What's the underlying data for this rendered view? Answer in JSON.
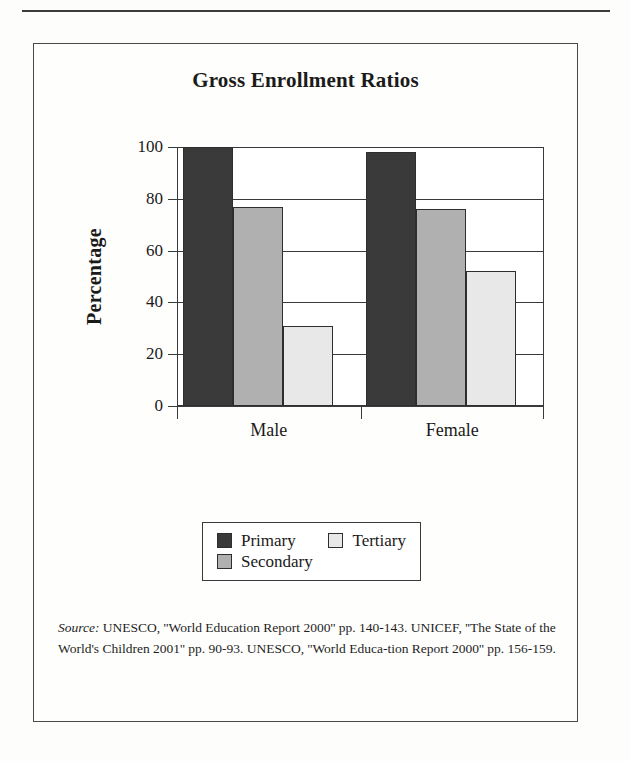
{
  "figure": {
    "title": "Gross Enrollment Ratios",
    "source_keyword": "Source:",
    "source_text": " UNESCO, ''World Education Report 2000'' pp. 140-143. UNICEF, ''The State of the World's Children 2001'' pp. 90-93. UNESCO, ''World Educa-tion Report 2000'' pp. 156-159."
  },
  "chart_data": {
    "type": "bar",
    "title": "Gross Enrollment Ratios",
    "xlabel": "",
    "ylabel": "Percentage",
    "ylim": [
      0,
      100
    ],
    "yticks": [
      0,
      20,
      40,
      60,
      80,
      100
    ],
    "ytick_labels": [
      "0",
      "20",
      "40",
      "60",
      "80",
      "100"
    ],
    "categories": [
      "Male",
      "Female"
    ],
    "grid": true,
    "legend_position": "below-plot",
    "series": [
      {
        "name": "Primary",
        "values": [
          100,
          98
        ],
        "color": "#3a3a3a"
      },
      {
        "name": "Secondary",
        "values": [
          77,
          76
        ],
        "color": "#b0b0b0"
      },
      {
        "name": "Tertiary",
        "values": [
          31,
          52
        ],
        "color": "#e8e8e8"
      }
    ]
  },
  "legend": {
    "rows": [
      [
        {
          "label": "Primary",
          "color": "#3a3a3a"
        },
        {
          "label": "Tertiary",
          "color": "#e8e8e8"
        }
      ],
      [
        {
          "label": "Secondary",
          "color": "#b0b0b0"
        }
      ]
    ]
  }
}
